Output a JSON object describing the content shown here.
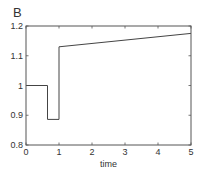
{
  "panel_label": "B",
  "chart_data": {
    "type": "line",
    "title": "",
    "panel_label": "B",
    "xlabel": "time",
    "ylabel": "",
    "xlim": [
      0,
      5
    ],
    "ylim": [
      0.8,
      1.2
    ],
    "xticks": [
      0,
      1,
      2,
      3,
      4,
      5
    ],
    "xtick_labels": [
      "0",
      "1",
      "2",
      "3",
      "4",
      "5"
    ],
    "yticks": [
      0.8,
      0.9,
      1.0,
      1.1,
      1.2
    ],
    "ytick_labels": [
      "0.8",
      "0.9",
      "1",
      "1.1",
      "1.2"
    ],
    "grid": false,
    "box": true,
    "legend": null,
    "series": [
      {
        "name": "signal",
        "color": "#444444",
        "x": [
          0,
          0.65,
          0.65,
          1.0,
          1.0,
          5.0
        ],
        "y": [
          1.0,
          1.0,
          0.886,
          0.886,
          1.13,
          1.175
        ]
      }
    ]
  },
  "style": {
    "axis_color": "#555555",
    "line_color": "#444444",
    "text_color": "#333333"
  }
}
